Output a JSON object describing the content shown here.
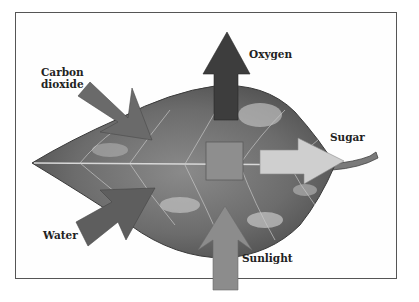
{
  "diagram": {
    "title": "",
    "labels": {
      "carbon_dioxide_line1": "Carbon",
      "carbon_dioxide_line2": "dioxide",
      "oxygen": "Oxygen",
      "sugar": "Sugar",
      "water": "Water",
      "sunlight": "Sunlight"
    },
    "arrows": [
      {
        "name": "carbon-dioxide",
        "direction": "in",
        "color": "#6a6a6a"
      },
      {
        "name": "water",
        "direction": "in",
        "color": "#5e5e5e"
      },
      {
        "name": "sunlight",
        "direction": "in",
        "color": "#8c8c8c"
      },
      {
        "name": "oxygen",
        "direction": "out",
        "color": "#3d3d3d"
      },
      {
        "name": "sugar",
        "direction": "out",
        "color": "#cfcfcf"
      }
    ],
    "colors": {
      "leaf_dark": "#4a4a4a",
      "leaf_mid": "#7a7a7a",
      "leaf_light": "#b5b5b5",
      "center_square": "#8e8e8e",
      "frame": "#555555"
    }
  }
}
